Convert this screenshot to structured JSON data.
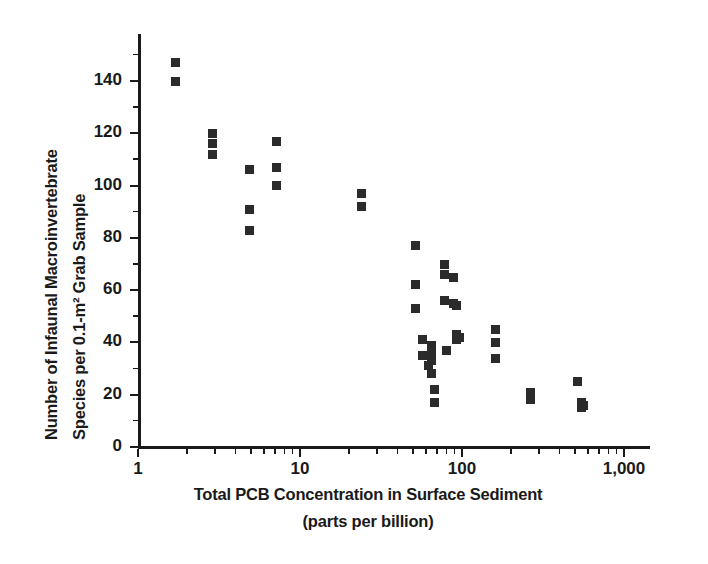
{
  "chart_data": {
    "type": "scatter",
    "title": "",
    "xlabel": "Total PCB Concentration in Surface Sediment (parts per billion)",
    "ylabel": "Number of Infaunal Macroinvertebrate Species per 0.1-m2 Grab Sample",
    "xscale": "log",
    "yscale": "linear",
    "xlim": [
      1,
      1000
    ],
    "ylim": [
      0,
      158
    ],
    "grid": false,
    "legend": null,
    "xticks": [
      1,
      10,
      100,
      1000
    ],
    "xticklabels": [
      "1",
      "10",
      "100",
      "1,000"
    ],
    "yticks": [
      0,
      20,
      40,
      60,
      80,
      100,
      120,
      140
    ],
    "yticklabels": [
      "0",
      "20",
      "40",
      "60",
      "80",
      "100",
      "120",
      "140"
    ],
    "marker": "square",
    "marker_color": "#2b2b2b",
    "points": [
      {
        "x": 1.7,
        "y": 147
      },
      {
        "x": 1.7,
        "y": 140
      },
      {
        "x": 2.9,
        "y": 120
      },
      {
        "x": 2.9,
        "y": 116
      },
      {
        "x": 2.9,
        "y": 112
      },
      {
        "x": 4.9,
        "y": 106
      },
      {
        "x": 4.9,
        "y": 91
      },
      {
        "x": 4.9,
        "y": 83
      },
      {
        "x": 7.2,
        "y": 117
      },
      {
        "x": 7.2,
        "y": 107
      },
      {
        "x": 7.2,
        "y": 100
      },
      {
        "x": 24,
        "y": 97
      },
      {
        "x": 24,
        "y": 92
      },
      {
        "x": 52,
        "y": 77
      },
      {
        "x": 52,
        "y": 62
      },
      {
        "x": 52,
        "y": 53
      },
      {
        "x": 57,
        "y": 41
      },
      {
        "x": 57,
        "y": 35
      },
      {
        "x": 62,
        "y": 31
      },
      {
        "x": 65,
        "y": 39
      },
      {
        "x": 65,
        "y": 36
      },
      {
        "x": 65,
        "y": 33
      },
      {
        "x": 65,
        "y": 28
      },
      {
        "x": 68,
        "y": 22
      },
      {
        "x": 68,
        "y": 17
      },
      {
        "x": 78,
        "y": 70
      },
      {
        "x": 78,
        "y": 66
      },
      {
        "x": 78,
        "y": 56
      },
      {
        "x": 80,
        "y": 37
      },
      {
        "x": 88,
        "y": 65
      },
      {
        "x": 88,
        "y": 55
      },
      {
        "x": 92,
        "y": 54
      },
      {
        "x": 92,
        "y": 43
      },
      {
        "x": 92,
        "y": 41
      },
      {
        "x": 97,
        "y": 42
      },
      {
        "x": 160,
        "y": 45
      },
      {
        "x": 160,
        "y": 40
      },
      {
        "x": 160,
        "y": 34
      },
      {
        "x": 265,
        "y": 21
      },
      {
        "x": 265,
        "y": 18
      },
      {
        "x": 520,
        "y": 25
      },
      {
        "x": 545,
        "y": 17
      },
      {
        "x": 545,
        "y": 15
      },
      {
        "x": 560,
        "y": 16
      }
    ]
  },
  "axes": {
    "y_title_line1": "Number of Infaunal Macroinvertebrate",
    "y_title_line2": "Species per 0.1-m² Grab Sample",
    "x_caption_line1": "Total PCB Concentration in Surface Sediment",
    "x_caption_line2": "(parts per billion)"
  }
}
